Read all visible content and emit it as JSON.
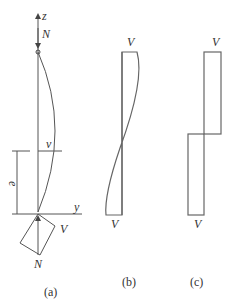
{
  "figure_a": {
    "axis_z": "z",
    "axis_y": "y",
    "force_top": "N",
    "deflection": "v",
    "eccentricity": "e",
    "shear_label": "V",
    "force_bottom": "N",
    "caption": "(a)"
  },
  "figure_b": {
    "top_label": "V",
    "bottom_label": "V",
    "caption": "(b)"
  },
  "figure_c": {
    "top_label": "V",
    "bottom_label": "V",
    "caption": "(c)"
  }
}
